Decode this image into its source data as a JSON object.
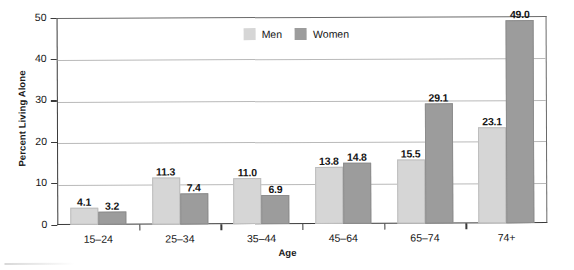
{
  "chart_data": {
    "type": "bar",
    "title": "",
    "xlabel": "Age",
    "ylabel": "Percent Living Alone",
    "categories": [
      "15–24",
      "25–34",
      "35–44",
      "45–64",
      "65–74",
      "74+"
    ],
    "series": [
      {
        "name": "Men",
        "color": "#d6d6d6",
        "values": [
          4.1,
          11.3,
          11.0,
          13.8,
          15.5,
          23.1
        ]
      },
      {
        "name": "Women",
        "color": "#9c9c9c",
        "values": [
          3.2,
          7.4,
          6.9,
          14.8,
          29.1,
          49.0
        ]
      }
    ],
    "value_labels": {
      "men": [
        "4.1",
        "11.3",
        "11.0",
        "13.8",
        "15.5",
        "23.1"
      ],
      "women": [
        "3.2",
        "7.4",
        "6.9",
        "14.8",
        "29.1",
        "49.0"
      ]
    },
    "ylim": [
      0,
      50
    ],
    "yticks": [
      "0",
      "10",
      "20",
      "30",
      "40",
      "50"
    ],
    "grid": true,
    "legend_position": "top-center"
  },
  "legend": {
    "items": [
      {
        "label": "Men",
        "color": "#d6d6d6"
      },
      {
        "label": "Women",
        "color": "#9c9c9c"
      }
    ]
  },
  "axes": {
    "y_title": "Percent Living Alone",
    "x_title": "Age"
  }
}
